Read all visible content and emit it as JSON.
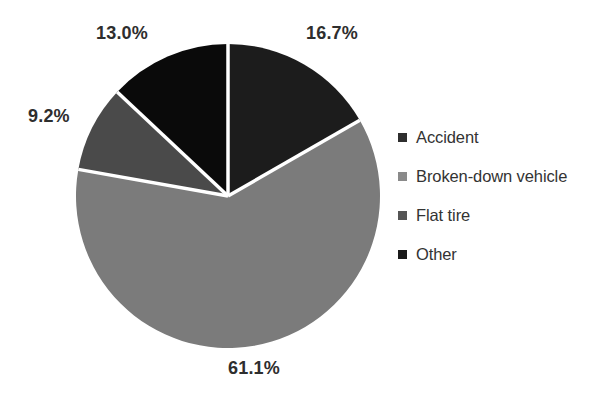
{
  "chart_data": {
    "type": "pie",
    "title": "",
    "categories": [
      "Accident",
      "Broken-down vehicle",
      "Flat tire",
      "Other"
    ],
    "values": [
      16.7,
      61.1,
      9.2,
      13.0
    ],
    "value_labels": [
      "16.7%",
      "61.1%",
      "9.2%",
      "13.0%"
    ],
    "units": "percent",
    "start_angle_deg": 0,
    "direction": "clockwise",
    "grid": false,
    "legend_position": "right",
    "slice_colors": [
      "#1c1c1c",
      "#7b7b7b",
      "#4a4a4a",
      "#0a0a0a"
    ],
    "separator_color": "#ffffff",
    "background_color": "#ffffff",
    "label_color": "#2e2e2e",
    "slices": [
      {
        "name": "Accident",
        "value": 16.7,
        "label": "16.7%",
        "color": "#1c1c1c"
      },
      {
        "name": "Broken-down vehicle",
        "value": 61.1,
        "label": "61.1%",
        "color": "#7b7b7b"
      },
      {
        "name": "Flat tire",
        "value": 9.2,
        "label": "9.2%",
        "color": "#4a4a4a"
      },
      {
        "name": "Other",
        "value": 13.0,
        "label": "13.0%",
        "color": "#0a0a0a"
      }
    ]
  },
  "labels": {
    "accident_pct": "16.7%",
    "broken_pct": "61.1%",
    "flat_pct": "9.2%",
    "other_pct": "13.0%"
  },
  "legend": {
    "items": [
      {
        "label": "Accident",
        "color": "#2e2e2e"
      },
      {
        "label": "Broken-down vehicle",
        "color": "#8a8a8a"
      },
      {
        "label": "Flat tire",
        "color": "#555555"
      },
      {
        "label": "Other",
        "color": "#1a1a1a"
      }
    ]
  },
  "geometry": {
    "center_x": 228,
    "center_y": 196,
    "radius": 152
  }
}
